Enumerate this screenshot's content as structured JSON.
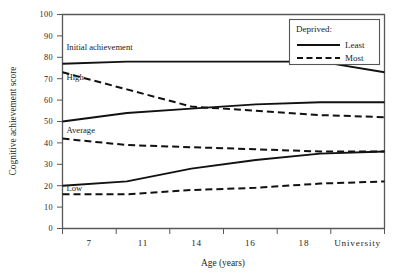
{
  "chart_data": {
    "type": "line",
    "title": "",
    "xlabel": "Age (years)",
    "ylabel": "Cognitive achievement score",
    "xlim": [
      0,
      6
    ],
    "ylim": [
      0,
      100
    ],
    "ytick_step": 10,
    "grid": false,
    "legend_position": "top-right",
    "legend_title": "Deprived:",
    "categories": [
      "7",
      "11",
      "14",
      "16",
      "18",
      "University"
    ],
    "ytick_labels": [
      "0",
      "10",
      "20",
      "30",
      "40",
      "50",
      "60",
      "70",
      "80",
      "90",
      "100"
    ],
    "annotations": [
      {
        "text": "Initial achievement",
        "x_category": "7",
        "value": 85
      },
      {
        "text": "High",
        "x_category": "7",
        "value": 71
      },
      {
        "text": "Average",
        "x_category": "7",
        "value": 46
      },
      {
        "text": "Low",
        "x_category": "7",
        "value": 19
      }
    ],
    "series": [
      {
        "name": "High initial achievement, Least deprived",
        "group": "High",
        "deprived": "Least",
        "style": "solid",
        "values": [
          77,
          78,
          78,
          78,
          78,
          73
        ]
      },
      {
        "name": "High initial achievement, Most deprived",
        "group": "High",
        "deprived": "Most",
        "style": "dashed",
        "values": [
          73,
          65,
          57,
          55,
          53,
          52
        ]
      },
      {
        "name": "Average initial achievement, Least deprived",
        "group": "Average",
        "deprived": "Least",
        "style": "solid",
        "values": [
          50,
          54,
          56,
          58,
          59,
          59
        ]
      },
      {
        "name": "Average initial achievement, Most deprived",
        "group": "Average",
        "deprived": "Most",
        "style": "dashed",
        "values": [
          42,
          39,
          38,
          37,
          36,
          36
        ]
      },
      {
        "name": "Low initial achievement, Least deprived",
        "group": "Low",
        "deprived": "Least",
        "style": "solid",
        "values": [
          20,
          22,
          28,
          32,
          35,
          36
        ]
      },
      {
        "name": "Low initial achievement, Most deprived",
        "group": "Low",
        "deprived": "Most",
        "style": "dashed",
        "values": [
          16,
          16,
          18,
          19,
          21,
          22
        ]
      }
    ],
    "legend_entries": [
      {
        "label": "Least",
        "style": "solid"
      },
      {
        "label": "Most",
        "style": "dashed"
      }
    ]
  }
}
